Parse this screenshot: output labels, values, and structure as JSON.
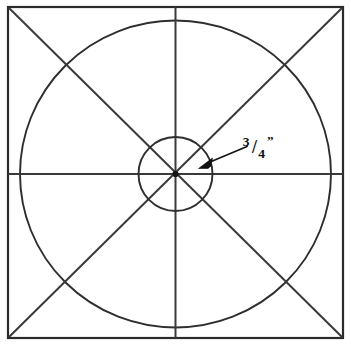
{
  "figure": {
    "background_color": "#ffffff",
    "line_color": "#2e2e2e",
    "text_color": "#0d0d0d",
    "width": 351,
    "height": 346
  },
  "frame": {
    "name": "outer square border",
    "left": 8,
    "top": 7,
    "right": 343,
    "bottom": 338,
    "stroke_width": 2.2
  },
  "center": {
    "label": "center point",
    "x": 175.5,
    "y": 174.0
  },
  "circles": [
    {
      "name": "outer-circle",
      "cx": 175.5,
      "cy": 174.0,
      "rx": 155.5,
      "ry": 153.5,
      "stroke_width": 1.9
    },
    {
      "name": "inner-circle",
      "cx": 175.5,
      "cy": 174.0,
      "rx": 37.0,
      "ry": 37.0,
      "stroke_width": 1.9
    }
  ],
  "axes": [
    {
      "name": "horizontal-axis",
      "x1": 8,
      "y1": 174.0,
      "x2": 343,
      "y2": 174.0
    },
    {
      "name": "vertical-axis",
      "x1": 175.5,
      "y1": 7,
      "x2": 175.5,
      "y2": 338
    }
  ],
  "diagonals": [
    {
      "name": "diagonal-tl-br",
      "x1": 9,
      "y1": 8,
      "x2": 342,
      "y2": 337
    },
    {
      "name": "diagonal-tr-bl",
      "x1": 342,
      "y1": 8,
      "x2": 9,
      "y2": 337
    }
  ],
  "annotation": {
    "name": "three-quarter-inch-callout",
    "numerator": "3",
    "denominator": "4",
    "separator": "/",
    "unit_mark": "”",
    "full_text": "3/4”",
    "reading": "three quarters of an inch",
    "text_x": 258,
    "text_y": 150,
    "leader": {
      "tail_x": 247,
      "tail_y": 146,
      "head_x": 200,
      "head_y": 166,
      "arrow_direction": "down-left",
      "points_to": "inner-circle"
    }
  }
}
